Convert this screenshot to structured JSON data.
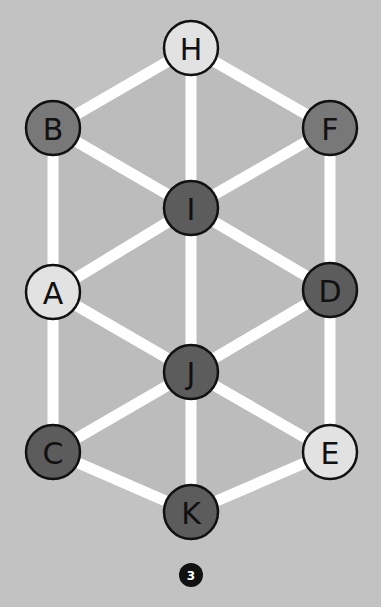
{
  "diagram": {
    "badge": "3",
    "colors": {
      "background": "#c2c2c2",
      "interior": "#bcbcbc",
      "edge": "#ffffff",
      "light_node": "#e2e2e2",
      "medium_node": "#787878",
      "dark_node": "#5c5c5c",
      "outline": "#111111",
      "badge": "#111111"
    },
    "nodes": [
      {
        "id": "H",
        "x": 191,
        "y": 48,
        "shade": "light"
      },
      {
        "id": "B",
        "x": 53,
        "y": 128,
        "shade": "medium"
      },
      {
        "id": "F",
        "x": 330,
        "y": 128,
        "shade": "medium"
      },
      {
        "id": "I",
        "x": 191,
        "y": 208,
        "shade": "dark"
      },
      {
        "id": "A",
        "x": 53,
        "y": 292,
        "shade": "light"
      },
      {
        "id": "D",
        "x": 330,
        "y": 290,
        "shade": "dark"
      },
      {
        "id": "J",
        "x": 191,
        "y": 372,
        "shade": "dark"
      },
      {
        "id": "C",
        "x": 53,
        "y": 452,
        "shade": "dark"
      },
      {
        "id": "E",
        "x": 330,
        "y": 452,
        "shade": "light"
      },
      {
        "id": "K",
        "x": 191,
        "y": 512,
        "shade": "dark"
      }
    ],
    "edges": [
      [
        "H",
        "B"
      ],
      [
        "H",
        "F"
      ],
      [
        "H",
        "I"
      ],
      [
        "B",
        "I"
      ],
      [
        "F",
        "I"
      ],
      [
        "B",
        "A"
      ],
      [
        "F",
        "D"
      ],
      [
        "I",
        "A"
      ],
      [
        "I",
        "D"
      ],
      [
        "I",
        "J"
      ],
      [
        "A",
        "J"
      ],
      [
        "D",
        "J"
      ],
      [
        "A",
        "C"
      ],
      [
        "D",
        "E"
      ],
      [
        "J",
        "C"
      ],
      [
        "J",
        "E"
      ],
      [
        "J",
        "K"
      ],
      [
        "C",
        "K"
      ],
      [
        "E",
        "K"
      ]
    ]
  }
}
